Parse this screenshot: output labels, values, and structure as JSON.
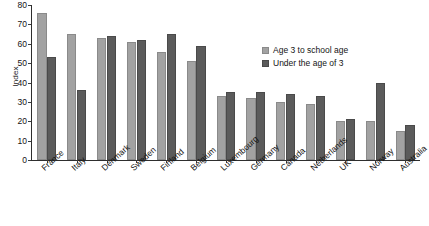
{
  "chart_data": {
    "type": "bar",
    "title": "",
    "subtitle": "",
    "xlabel": "",
    "ylabel": "Index",
    "ylim": [
      0,
      80
    ],
    "yticks": [
      0,
      10,
      20,
      30,
      40,
      50,
      60,
      70,
      80
    ],
    "grid": false,
    "legend_position": "inside-top-right",
    "categories": [
      "France",
      "Italy",
      "Denmark",
      "Sweden",
      "Finland",
      "Belgium",
      "Luxembourg",
      "Germany",
      "Canada",
      "Netherlands",
      "UK",
      "Norway",
      "Australia"
    ],
    "series": [
      {
        "name": "Age 3 to school age",
        "color": "#a2a2a2",
        "values": [
          76,
          65,
          63,
          61,
          56,
          51,
          33,
          32,
          30,
          29,
          20,
          20,
          15
        ]
      },
      {
        "name": "Under the age of 3",
        "color": "#5b5b5b",
        "values": [
          53,
          36,
          64,
          62,
          65,
          59,
          35,
          35,
          34,
          33,
          21,
          40,
          18
        ]
      }
    ]
  }
}
